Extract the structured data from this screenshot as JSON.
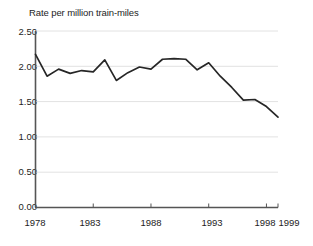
{
  "chart_data": {
    "type": "line",
    "title": "Rate per million train-miles",
    "xlabel": "",
    "ylabel": "Rate per million train-miles",
    "ylim": [
      0.0,
      2.5
    ],
    "xlim": [
      1978,
      1999
    ],
    "grid": true,
    "legend": false,
    "y_ticks": [
      0.0,
      0.5,
      1.0,
      1.5,
      2.0,
      2.5
    ],
    "y_tick_labels": [
      "0.00",
      "0.50",
      "1.00",
      "1.50",
      "2.00",
      "2.50"
    ],
    "x_ticks": [
      1978,
      1983,
      1988,
      1993,
      1998,
      1999
    ],
    "x_tick_labels": [
      "1978",
      "1983",
      "1988",
      "1993",
      "1998",
      "1999"
    ],
    "x": [
      1978,
      1979,
      1980,
      1981,
      1982,
      1983,
      1984,
      1985,
      1986,
      1987,
      1988,
      1989,
      1990,
      1991,
      1992,
      1993,
      1994,
      1995,
      1996,
      1997,
      1998,
      1999
    ],
    "values": [
      2.17,
      1.86,
      1.96,
      1.9,
      1.94,
      1.92,
      2.09,
      1.8,
      1.91,
      1.99,
      1.96,
      2.1,
      2.11,
      2.1,
      1.95,
      2.05,
      1.86,
      1.7,
      1.52,
      1.53,
      1.43,
      1.28
    ],
    "series": [
      {
        "name": "Rate per million train-miles",
        "color": "#262626",
        "values": [
          2.17,
          1.86,
          1.96,
          1.9,
          1.94,
          1.92,
          2.09,
          1.8,
          1.91,
          1.99,
          1.96,
          2.1,
          2.11,
          2.1,
          1.95,
          2.05,
          1.86,
          1.7,
          1.52,
          1.53,
          1.43,
          1.28
        ]
      }
    ],
    "colors": {
      "line": "#262626",
      "axis": "#555555",
      "grid": "#e2e2e2",
      "text": "#1d1d1d",
      "background": "#ffffff"
    }
  },
  "axis_title": "Rate per million train-miles",
  "y_labels": {
    "t0": "0.00",
    "t1": "0.50",
    "t2": "1.00",
    "t3": "1.50",
    "t4": "2.00",
    "t5": "2.50"
  },
  "x_labels": {
    "t0": "1978",
    "t1": "1983",
    "t2": "1988",
    "t3": "1993",
    "t4": "1998",
    "t5": "1999"
  }
}
